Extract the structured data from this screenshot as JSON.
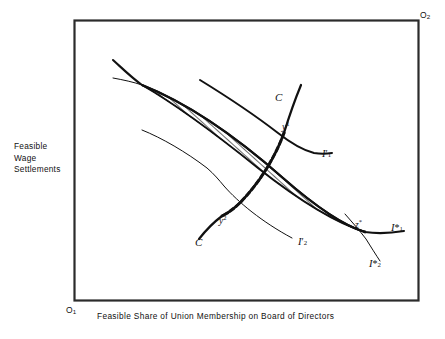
{
  "figure": {
    "type": "edgeworth-box-contract-curve",
    "axes": {
      "y_label": "Feasible\nWage\nSettlements",
      "x_label": "Feasible Share of Union Membership on Board of Directors",
      "origin_1": "O",
      "origin_1_sub": "1",
      "origin_2": "O",
      "origin_2_sub": "2"
    },
    "points": [
      {
        "id": "y1",
        "base": "y",
        "sup": "1",
        "x": 284,
        "y": 133
      },
      {
        "id": "y2",
        "base": "y",
        "sup": "2",
        "x": 222,
        "y": 216
      },
      {
        "id": "zstar",
        "base": "z",
        "sup": "*",
        "x": 358,
        "y": 227
      }
    ],
    "curve_labels": [
      {
        "id": "c-upper",
        "text": "C",
        "x": 277,
        "y": 98
      },
      {
        "id": "c-lower",
        "text": "C",
        "x": 197,
        "y": 243
      },
      {
        "id": "i1-prime",
        "base": "I",
        "prime": "′",
        "sub": "1",
        "x": 325,
        "y": 155
      },
      {
        "id": "i2-prime",
        "base": "I",
        "prime": "′",
        "sub": "2",
        "x": 301,
        "y": 243
      },
      {
        "id": "i1-star",
        "base": "I",
        "prime": "*",
        "sub": "1",
        "x": 393,
        "y": 229
      },
      {
        "id": "i2-star",
        "base": "I",
        "prime": "*",
        "sub": "2",
        "x": 371,
        "y": 265
      }
    ],
    "colors": {
      "box_border": "#2b2b2b",
      "curve": "#111111",
      "hatch": "#3a3a3a",
      "background": "#ffffff"
    },
    "geometry": {
      "box": {
        "x": 74,
        "y": 20,
        "width": 344,
        "height": 280
      },
      "lens_left_tip": [
        142,
        85
      ],
      "lens_right_tip": [
        365,
        232
      ]
    }
  }
}
